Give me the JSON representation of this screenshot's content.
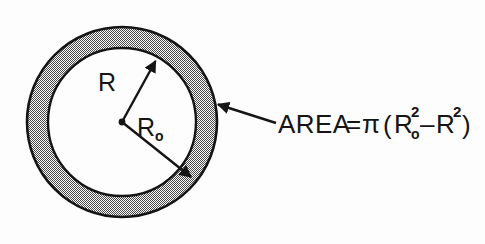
{
  "figure": {
    "background_color": "#fdfdfd",
    "ink_color": "#151515",
    "shaded_ring_color": "#9a9a9a",
    "inner_fill_color": "#ffffff"
  },
  "labels": {
    "inner_radius": "R",
    "outer_radius_base": "R",
    "outer_radius_subscript": "o"
  },
  "formula": {
    "lhs": "AREA",
    "equals": "=",
    "pi": "π",
    "open_paren": "(",
    "term1_base": "R",
    "term1_subscript": "o",
    "term1_exponent": "2",
    "minus": "–",
    "term2_base": "R",
    "term2_exponent": "2",
    "close_paren": ")",
    "full_text": "AREA = π ( Rₒ² – R² )"
  },
  "geometry": {
    "center_x": 122,
    "center_y": 122,
    "outer_radius": 95,
    "inner_radius": 74,
    "inner_arrow_tip_x": 158,
    "inner_arrow_tip_y": 57,
    "outer_arrow_tip_x": 195,
    "outer_arrow_tip_y": 182,
    "leader_start_x": 276,
    "leader_start_y": 123,
    "leader_tip_x": 214,
    "leader_tip_y": 103
  }
}
